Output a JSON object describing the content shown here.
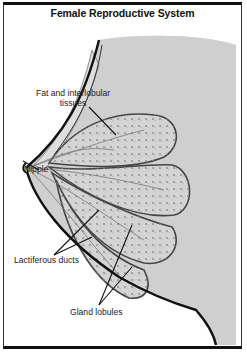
{
  "title": "Female Reproductive System",
  "labels": {
    "fat_line1": "Fat and interlobular",
    "fat_line2": "tissues",
    "nipple": "Nipple",
    "ducts": "Lactiferous ducts",
    "gland": "Gland lobules"
  },
  "colors": {
    "tissue_shade": "#c9c9c9",
    "lobule_fill": "#d6d6d6",
    "outline": "#111111",
    "duct": "#888888"
  }
}
